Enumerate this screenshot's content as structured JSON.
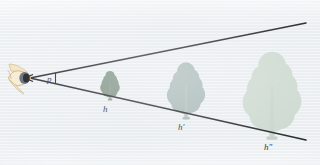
{
  "figure": {
    "background_color": "#eef1f3"
  },
  "observer": {
    "icon_name": "eye-icon",
    "label": "",
    "eye_outline_color": "#d8c191",
    "eye_fill_color": "#f3e3bf",
    "pupil_color": "#1a1a1c",
    "iris_color": "#4a5560",
    "position": {
      "x": 24,
      "y": 78
    }
  },
  "angle": {
    "symbol": "p",
    "description": "angular size subtended at the eye",
    "vertex": {
      "x": 30,
      "y": 78
    },
    "marker_color": "#2a2d31"
  },
  "sight_lines": {
    "color": "#23262a",
    "upper": {
      "x1": 30,
      "y1": 78,
      "x2": 306,
      "y2": 23
    },
    "lower": {
      "x1": 30,
      "y1": 78,
      "x2": 306,
      "y2": 140
    }
  },
  "objects": [
    {
      "name": "tree-near",
      "height_label": "h",
      "canopy_color": "#7c9183",
      "trunk_color": "#8a9a8e",
      "center_x": 110,
      "base_y": 100,
      "scale": 1.0
    },
    {
      "name": "tree-middle",
      "height_label": "h′",
      "canopy_color": "#a7b8b4",
      "trunk_color": "#b0bdb9",
      "center_x": 186,
      "base_y": 119,
      "scale": 1.95
    },
    {
      "name": "tree-far",
      "height_label": "h″",
      "canopy_color": "#ccd9cf",
      "trunk_color": "#c9d4cd",
      "center_x": 272,
      "base_y": 139,
      "scale": 3.0
    }
  ],
  "labels": {
    "angle": "p",
    "h_near": "h",
    "h_middle": "h′",
    "h_far": "h″"
  }
}
